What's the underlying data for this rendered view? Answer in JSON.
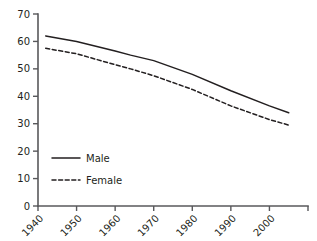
{
  "chart_data": {
    "type": "line",
    "title": "",
    "subtitle": "",
    "xlabel": "",
    "ylabel": "",
    "xlim": [
      1940,
      2010
    ],
    "ylim": [
      0,
      70
    ],
    "grid": false,
    "legend_position": "inside-lower-left",
    "x_ticks": [
      1940,
      1950,
      1960,
      1970,
      1980,
      1990,
      2000,
      2010
    ],
    "x_tick_labels": [
      "1940",
      "1950",
      "1960",
      "1970",
      "1980",
      "1990",
      "2000",
      ""
    ],
    "y_ticks": [
      0,
      10,
      20,
      30,
      40,
      50,
      60,
      70
    ],
    "y_tick_labels": [
      "0",
      "10",
      "20",
      "30",
      "40",
      "50",
      "60",
      "70"
    ],
    "series": [
      {
        "name": "Male",
        "style": "solid",
        "color": "#231f20",
        "x": [
          1942,
          1950,
          1960,
          1964,
          1970,
          1980,
          1990,
          2000,
          2005
        ],
        "values": [
          62,
          60,
          56.5,
          55,
          53,
          48,
          42,
          36.5,
          34
        ]
      },
      {
        "name": "Female",
        "style": "dashed",
        "color": "#231f20",
        "x": [
          1942,
          1950,
          1960,
          1964,
          1970,
          1980,
          1990,
          2000,
          2005
        ],
        "values": [
          57.5,
          55.5,
          51.5,
          50,
          47.5,
          42.5,
          36.5,
          31.5,
          29.5
        ]
      }
    ]
  },
  "legend": {
    "entries": [
      {
        "label": "Male",
        "style": "solid"
      },
      {
        "label": "Female",
        "style": "dashed"
      }
    ]
  },
  "axes": {
    "x_axis_name": "year-axis",
    "y_axis_name": "value-axis"
  }
}
